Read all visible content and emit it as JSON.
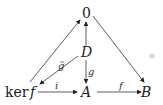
{
  "diagram": {
    "type": "commutative-diagram",
    "nodes": {
      "zero": "0",
      "d": "D",
      "kerf_ker": "ker",
      "kerf_f": "f",
      "a": "A",
      "b": "B"
    },
    "edges": [
      {
        "from": "ker f",
        "to": "0",
        "label": ""
      },
      {
        "from": "0",
        "to": "B",
        "label": ""
      },
      {
        "from": "D",
        "to": "0",
        "label": ""
      },
      {
        "from": "D",
        "to": "ker f",
        "label": "g̃"
      },
      {
        "from": "D",
        "to": "A",
        "label": "g"
      },
      {
        "from": "ker f",
        "to": "A",
        "label": "i"
      },
      {
        "from": "A",
        "to": "B",
        "label": "f"
      }
    ],
    "labels": {
      "gtilde": "g̃",
      "g": "g",
      "i": "i",
      "f": "f"
    },
    "colors": {
      "stroke": "#333333",
      "marker": "#999999"
    }
  }
}
